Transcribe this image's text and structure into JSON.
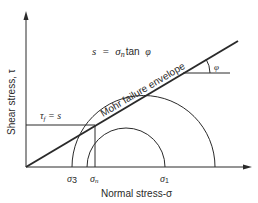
{
  "diagram": {
    "equation": {
      "lhs": "s",
      "eq": "=",
      "sigma": "σ",
      "sub_n": "n",
      "tan": "tan",
      "phi": "φ"
    },
    "envelope_label": "Mohr failure envelope",
    "angle_label": "φ",
    "tau_f_label": {
      "tau": "τ",
      "sub_f": "f",
      "rest": " = s"
    },
    "y_axis_label": "Shear stress, τ",
    "x_axis_label": "Normal stress-σ",
    "x_ticks": [
      {
        "sym": "σ",
        "sub": "3"
      },
      {
        "sym": "σ",
        "sub": "n"
      },
      {
        "sym": "σ",
        "sub": "1"
      }
    ],
    "colors": {
      "line": "#2a2a2a",
      "background": "#ffffff"
    }
  }
}
